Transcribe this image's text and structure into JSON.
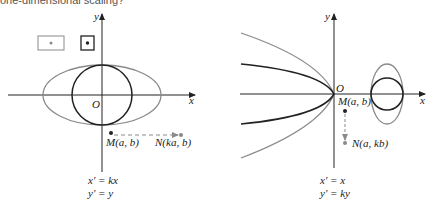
{
  "top_text": "one-dimensional scaling?",
  "left_panel": {
    "x_label": "x",
    "y_label": "y",
    "origin_label": "O",
    "point_m": "M(a, b)",
    "point_n": "N(ka, b)",
    "eq1": "x′ = kx",
    "eq2": "y′ = y"
  },
  "right_panel": {
    "x_label": "x",
    "y_label": "y",
    "origin_label": "O",
    "point_m": "M(a, b)",
    "point_n": "N(a, kb)",
    "eq1": "x′ = x",
    "eq2": "y′ = ky"
  },
  "colors": {
    "dark": "#222222",
    "gray": "#8a8a8a"
  }
}
